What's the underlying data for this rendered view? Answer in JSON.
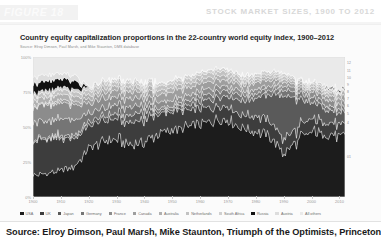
{
  "header": {
    "figure_tag": "FIGURE 18",
    "title": "STOCK MARKET SIZES, 1900 TO 2012"
  },
  "figure": {
    "chart_title": "Country equity capitalization proportions in the 22-country world equity index, 1900–2012",
    "source_note": "Source: Elroy Dimson, Paul Marsh, and Mike Staunton, DMS database"
  },
  "caption": {
    "text": "Source: Elroy Dimson, Paul Marsh, Mike Staunton, Triumph of the Optimists, Princeton"
  },
  "right_labels": [
    {
      "text": "12",
      "top": 4
    },
    {
      "text": "11",
      "top": 12
    },
    {
      "text": "10",
      "top": 19
    },
    {
      "text": "9",
      "top": 26
    },
    {
      "text": "8",
      "top": 33
    },
    {
      "text": "7",
      "top": 40
    },
    {
      "text": "6",
      "top": 47
    },
    {
      "text": "5",
      "top": 55
    },
    {
      "text": "4",
      "top": 64
    },
    {
      "text": "01",
      "top": 98
    }
  ],
  "chart_data": {
    "type": "area",
    "title": "Country equity capitalization proportions in the 22-country world equity index, 1900–2012",
    "xlabel": "",
    "ylabel": "",
    "ylim": [
      0,
      100
    ],
    "xlim": [
      1900,
      2012
    ],
    "stacked": true,
    "normalized": true,
    "grid": false,
    "legend_position": "bottom",
    "ytick_labels": [
      "100%",
      "75%",
      "50%",
      "25%",
      "0%"
    ],
    "ytick_values": [
      100,
      75,
      50,
      25,
      0
    ],
    "xtick_labels": [
      "1900",
      "1910",
      "1920",
      "1930",
      "1940",
      "1950",
      "1960",
      "1970",
      "1980",
      "1990",
      "2000",
      "2010"
    ],
    "xtick_values": [
      1900,
      1910,
      1920,
      1930,
      1940,
      1950,
      1960,
      1970,
      1980,
      1990,
      2000,
      2010
    ],
    "x": [
      1900,
      1905,
      1910,
      1915,
      1920,
      1925,
      1930,
      1935,
      1940,
      1945,
      1950,
      1955,
      1960,
      1965,
      1970,
      1975,
      1980,
      1985,
      1990,
      1995,
      2000,
      2005,
      2010,
      2012
    ],
    "series": [
      {
        "name": "USA",
        "color": "#1c1c1c",
        "values": [
          15,
          17,
          19,
          22,
          35,
          40,
          42,
          38,
          39,
          46,
          48,
          50,
          52,
          55,
          56,
          50,
          47,
          44,
          31,
          40,
          47,
          45,
          43,
          44
        ]
      },
      {
        "name": "UK",
        "color": "#3d3d3d",
        "values": [
          25,
          24,
          23,
          21,
          16,
          15,
          14,
          15,
          16,
          14,
          13,
          12,
          11,
          10,
          10,
          9,
          11,
          11,
          10,
          9,
          9,
          9,
          8,
          8
        ]
      },
      {
        "name": "Japan",
        "color": "#5a5a5a",
        "values": [
          1,
          1,
          2,
          2,
          3,
          3,
          4,
          5,
          6,
          2,
          2,
          3,
          5,
          6,
          7,
          10,
          13,
          19,
          32,
          20,
          12,
          10,
          8,
          8
        ]
      },
      {
        "name": "Germany",
        "color": "#757575",
        "values": [
          13,
          12,
          12,
          11,
          6,
          6,
          6,
          6,
          5,
          2,
          2,
          3,
          4,
          4,
          4,
          4,
          3,
          3,
          4,
          4,
          4,
          3,
          3,
          3
        ]
      },
      {
        "name": "France",
        "color": "#8c8c8c",
        "values": [
          11,
          11,
          11,
          10,
          7,
          7,
          6,
          6,
          5,
          5,
          4,
          4,
          4,
          4,
          3,
          3,
          3,
          3,
          3,
          3,
          4,
          4,
          4,
          4
        ]
      },
      {
        "name": "Canada",
        "color": "#9e9e9e",
        "values": [
          1,
          1,
          2,
          2,
          3,
          4,
          5,
          5,
          4,
          5,
          6,
          6,
          5,
          5,
          4,
          4,
          5,
          4,
          3,
          2,
          2,
          3,
          4,
          4
        ]
      },
      {
        "name": "Australia",
        "color": "#b0b0b0",
        "values": [
          4,
          4,
          4,
          4,
          3,
          3,
          3,
          3,
          3,
          3,
          3,
          3,
          3,
          3,
          3,
          2,
          2,
          2,
          2,
          2,
          2,
          2,
          3,
          3
        ]
      },
      {
        "name": "Netherlands",
        "color": "#c2c2c2",
        "values": [
          3,
          3,
          3,
          3,
          3,
          3,
          3,
          3,
          3,
          3,
          3,
          3,
          3,
          3,
          3,
          3,
          2,
          2,
          2,
          2,
          2,
          2,
          1,
          1
        ]
      },
      {
        "name": "South Africa",
        "color": "#d0d0d0",
        "values": [
          2,
          2,
          2,
          2,
          2,
          2,
          2,
          2,
          2,
          2,
          2,
          2,
          2,
          2,
          2,
          2,
          2,
          2,
          2,
          1,
          1,
          1,
          1,
          1
        ]
      },
      {
        "name": "Russia",
        "color": "#111111",
        "values": [
          6,
          7,
          6,
          6,
          0,
          0,
          0,
          0,
          0,
          0,
          0,
          0,
          0,
          0,
          0,
          0,
          0,
          0,
          0,
          0,
          0,
          1,
          1,
          1
        ]
      },
      {
        "name": "Austria",
        "color": "#dddddd",
        "values": [
          5,
          4,
          4,
          4,
          1,
          0,
          0,
          0,
          0,
          0,
          0,
          0,
          0,
          0,
          0,
          0,
          0,
          0,
          0,
          0,
          0,
          0,
          0,
          0
        ]
      },
      {
        "name": "All others",
        "color": "#eaeaea",
        "values": [
          14,
          14,
          12,
          13,
          21,
          17,
          15,
          17,
          17,
          18,
          17,
          14,
          11,
          8,
          8,
          13,
          12,
          10,
          11,
          17,
          17,
          20,
          24,
          23
        ]
      }
    ],
    "legend": [
      {
        "label": "USA",
        "color": "#1c1c1c"
      },
      {
        "label": "UK",
        "color": "#3d3d3d"
      },
      {
        "label": "Japan",
        "color": "#5a5a5a"
      },
      {
        "label": "Germany",
        "color": "#757575"
      },
      {
        "label": "France",
        "color": "#8c8c8c"
      },
      {
        "label": "Canada",
        "color": "#9e9e9e"
      },
      {
        "label": "Australia",
        "color": "#b0b0b0"
      },
      {
        "label": "Netherlands",
        "color": "#c2c2c2"
      },
      {
        "label": "South Africa",
        "color": "#d0d0d0"
      },
      {
        "label": "Russia",
        "color": "#111111"
      },
      {
        "label": "Austria",
        "color": "#dddddd"
      },
      {
        "label": "All others",
        "color": "#eaeaea"
      }
    ]
  }
}
